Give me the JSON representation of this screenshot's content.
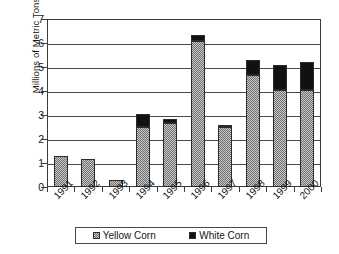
{
  "chart_data": {
    "type": "bar",
    "subtype": "stacked-bar",
    "title": "",
    "xlabel": "",
    "ylabel": "Millions of Metric Tons",
    "categories": [
      "1991",
      "1992",
      "1993",
      "1994",
      "1995",
      "1996",
      "1997",
      "1998",
      "1999",
      "2000"
    ],
    "series": [
      {
        "name": "Yellow Corn",
        "color": "#8d8d8d",
        "pattern": "checkered-gray",
        "values": [
          1.3,
          1.15,
          0.3,
          2.5,
          2.65,
          6.1,
          2.5,
          4.65,
          4.05,
          4.05
        ]
      },
      {
        "name": "White Corn",
        "color": "#111111",
        "pattern": "solid-black",
        "values": [
          0.0,
          0.0,
          0.0,
          0.55,
          0.2,
          0.25,
          0.1,
          0.65,
          1.05,
          1.15
        ]
      }
    ],
    "totals": [
      1.3,
      1.15,
      0.3,
      3.05,
      2.85,
      6.35,
      2.6,
      5.3,
      5.1,
      5.2
    ],
    "ylim": [
      0,
      7
    ],
    "ytick_labels": [
      "0",
      "1",
      "2",
      "3",
      "4",
      "5",
      "6",
      "7"
    ],
    "ytick_values": [
      0,
      1,
      2,
      3,
      4,
      5,
      6,
      7
    ],
    "grid": true,
    "grid_axis": "y",
    "legend_position": "bottom",
    "legend_entries": [
      "Yellow Corn",
      "White Corn"
    ]
  },
  "legend": {
    "items": [
      {
        "label": "Yellow Corn",
        "swatch": "yellow-corn-swatch"
      },
      {
        "label": "White Corn",
        "swatch": "white-corn-swatch"
      }
    ]
  }
}
